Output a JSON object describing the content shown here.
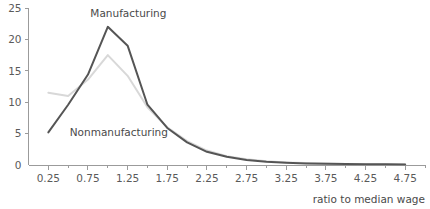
{
  "chart_data": {
    "type": "line",
    "title": "",
    "xlabel": "ratio to median wage",
    "ylabel": "",
    "xlim": [
      0.0,
      5.0
    ],
    "ylim": [
      0,
      25
    ],
    "grid": false,
    "legend_position": "inline-annotation",
    "y_ticks": [
      0,
      5,
      10,
      15,
      20,
      25
    ],
    "y_tick_labels": [
      "0",
      "5",
      "10",
      "15",
      "20",
      "25"
    ],
    "x_ticks": [
      0.25,
      0.5,
      0.75,
      1.0,
      1.25,
      1.5,
      1.75,
      2.0,
      2.25,
      2.5,
      2.75,
      3.0,
      3.25,
      3.5,
      3.75,
      4.0,
      4.25,
      4.5,
      4.75,
      5.0
    ],
    "x_labeled_ticks": [
      0.25,
      0.75,
      1.25,
      1.75,
      2.25,
      2.75,
      3.25,
      3.75,
      4.25,
      4.75
    ],
    "x_tick_labels": [
      "0.25",
      "0.75",
      "1.25",
      "1.75",
      "2.25",
      "2.75",
      "3.25",
      "3.75",
      "4.25",
      "4.75"
    ],
    "x": [
      0.25,
      0.5,
      0.75,
      1.0,
      1.25,
      1.5,
      1.75,
      2.0,
      2.25,
      2.5,
      2.75,
      3.0,
      3.25,
      3.5,
      3.75,
      4.0,
      4.25,
      4.5,
      4.75
    ],
    "series": [
      {
        "name": "Manufacturing",
        "color": "#555555",
        "width": 2.0,
        "values": [
          5.2,
          9.6,
          14.4,
          22.0,
          19.0,
          9.6,
          5.9,
          3.6,
          2.1,
          1.3,
          0.8,
          0.5,
          0.35,
          0.25,
          0.2,
          0.15,
          0.12,
          0.1,
          0.08
        ],
        "label_x": 0.78,
        "label_y": 23.6
      },
      {
        "name": "Nonmanufacturing",
        "color": "#d8d8d8",
        "width": 2.0,
        "values": [
          11.5,
          11.0,
          13.6,
          17.5,
          14.2,
          9.2,
          6.0,
          3.8,
          2.3,
          1.4,
          0.9,
          0.6,
          0.4,
          0.3,
          0.22,
          0.17,
          0.13,
          0.1,
          0.08
        ],
        "label_x": 0.52,
        "label_y": 4.6
      }
    ]
  },
  "axis": {
    "x_title": "ratio to median wage"
  }
}
